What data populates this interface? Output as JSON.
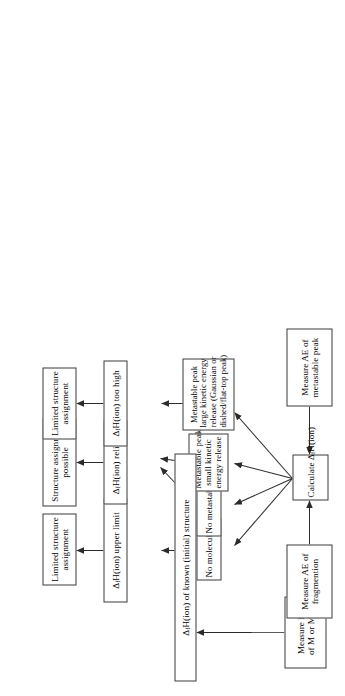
{
  "diagram": {
    "orientation": "rotated-90-ccw",
    "boxes": {
      "measure_ie": {
        "lines": [
          "Measure IE",
          "of M or M•⁺"
        ],
        "plain": "Measure IE of M or M+•"
      },
      "known_structure": {
        "lines": [
          "ΔfH(ion) of known (initial) structure"
        ],
        "plain": "ΔfH(ion) of known (initial) structure"
      },
      "measure_ae_frag": {
        "lines": [
          "Measure AE of",
          "fragmention"
        ],
        "plain": "Measure AE of fragmention"
      },
      "calculate": {
        "lines": [
          "Calculate ΔfH(ion)"
        ],
        "plain": "Calculate ΔfH(ion)"
      },
      "measure_ae_meta": {
        "lines": [
          "Measure AE of",
          "metastable peak"
        ],
        "plain": "Measure AE of metastable peak"
      },
      "no_molecular_ion": {
        "lines": [
          "No molecular ion"
        ],
        "plain": "No molecular ion"
      },
      "no_metastable_peak": {
        "lines": [
          "No metastable peak"
        ],
        "plain": "No metastable peak"
      },
      "meta_small_ke": {
        "lines": [
          "Metastable peak",
          "small kinetic",
          "energy release"
        ],
        "plain": "Metastable peak small kinetic energy release"
      },
      "meta_large_ke": {
        "lines": [
          "Metastable peak",
          "large kinetic energy",
          "release (Gaussian or",
          "dished/flat-top peak)"
        ],
        "plain": "Metastable peak large kinetic energy release (Gaussian or dished/flat-top peak)"
      },
      "upper_limit": {
        "lines": [
          "ΔfH(ion) upper limit"
        ],
        "plain": "ΔfH(ion) upper limit"
      },
      "reliable": {
        "lines": [
          "ΔfH(ion) reliable"
        ],
        "plain": "ΔfH(ion) reliable"
      },
      "too_high": {
        "lines": [
          "ΔfH(ion) too high"
        ],
        "plain": "ΔfH(ion) too high"
      },
      "limited_assignment_a": {
        "lines": [
          "Limited structure",
          "assignment"
        ],
        "plain": "Limited structure assignment"
      },
      "structure_possible": {
        "lines": [
          "Structure assignment",
          "possible"
        ],
        "plain": "Structure assignment possible"
      },
      "limited_assignment_b": {
        "lines": [
          "Limited structure",
          "assignment"
        ],
        "plain": "Limited structure assignment"
      }
    },
    "colors": {
      "stroke": "#3a3a3a",
      "arrow": "#2b2b2b",
      "text": "#000000",
      "background": "#ffffff"
    }
  }
}
